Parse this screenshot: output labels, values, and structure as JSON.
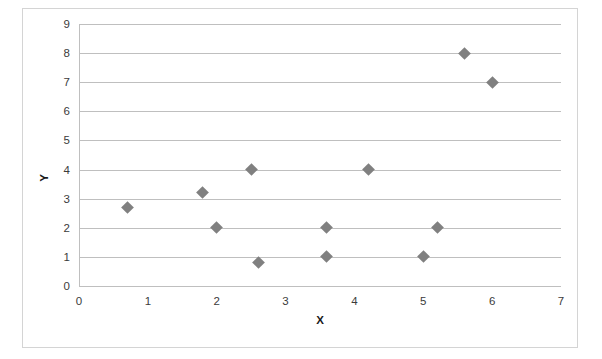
{
  "chart_data": {
    "type": "scatter",
    "title": "",
    "xlabel": "X",
    "ylabel": "Y",
    "xlim": [
      0,
      7
    ],
    "ylim": [
      0,
      9
    ],
    "x_ticks": [
      0,
      1,
      2,
      3,
      4,
      5,
      6,
      7
    ],
    "y_ticks": [
      0,
      1,
      2,
      3,
      4,
      5,
      6,
      7,
      8,
      9
    ],
    "grid": "horizontal",
    "legend": "none",
    "marker": "diamond",
    "marker_color": "#808080",
    "gridline_color": "#bfbfbf",
    "border_color": "#d4d4d4",
    "points": [
      {
        "x": 0.7,
        "y": 2.7
      },
      {
        "x": 1.8,
        "y": 3.2
      },
      {
        "x": 2.0,
        "y": 2.0
      },
      {
        "x": 2.5,
        "y": 4.0
      },
      {
        "x": 2.6,
        "y": 0.8
      },
      {
        "x": 3.6,
        "y": 2.0
      },
      {
        "x": 3.6,
        "y": 1.0
      },
      {
        "x": 4.2,
        "y": 4.0
      },
      {
        "x": 5.0,
        "y": 1.0
      },
      {
        "x": 5.2,
        "y": 2.0
      },
      {
        "x": 5.6,
        "y": 8.0
      },
      {
        "x": 6.0,
        "y": 7.0
      }
    ]
  }
}
